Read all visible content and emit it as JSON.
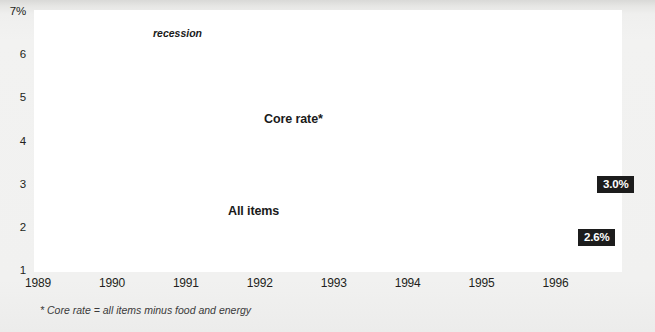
{
  "chart_data": {
    "type": "line",
    "title": "",
    "xlabel": "",
    "ylabel": "",
    "ylim": [
      1,
      7
    ],
    "xlim": [
      1989.0,
      1996.9
    ],
    "grid": true,
    "legend_position": "inline-annotations",
    "y_ticks": [
      "1",
      "2",
      "3",
      "4",
      "5",
      "6",
      "7%"
    ],
    "y_tick_values": [
      1,
      2,
      3,
      4,
      5,
      6,
      7
    ],
    "x_ticks": [
      "1989",
      "1990",
      "1991",
      "1992",
      "1993",
      "1994",
      "1995",
      "1996"
    ],
    "x_tick_values": [
      1989,
      1990,
      1991,
      1992,
      1993,
      1994,
      1995,
      1996
    ],
    "annotations": [
      {
        "text": "recession",
        "type": "band-label",
        "x_start": 1990.47,
        "x_end": 1991.27
      },
      {
        "text": "Core rate*",
        "type": "series-label",
        "series": "Core rate*"
      },
      {
        "text": "All items",
        "type": "series-label",
        "series": "All items"
      },
      {
        "text": "3.0%",
        "type": "end-callout",
        "series": "All items",
        "value": 3.0
      },
      {
        "text": "2.6%",
        "type": "end-callout",
        "series": "Core rate*",
        "value": 2.6
      }
    ],
    "footnote": "* Core rate = all items minus food and energy",
    "series": [
      {
        "name": "All items",
        "style": "solid",
        "color": "#8a8a8a",
        "x": [
          1989.0,
          1989.1,
          1989.2,
          1989.3,
          1989.4,
          1989.5,
          1989.6,
          1989.7,
          1989.8,
          1989.9,
          1990.0,
          1990.1,
          1990.2,
          1990.3,
          1990.4,
          1990.5,
          1990.6,
          1990.7,
          1990.8,
          1990.9,
          1991.0,
          1991.1,
          1991.2,
          1991.3,
          1991.4,
          1991.5,
          1991.6,
          1991.7,
          1991.8,
          1991.9,
          1992.0,
          1992.1,
          1992.2,
          1992.3,
          1992.4,
          1992.5,
          1992.6,
          1992.7,
          1992.8,
          1992.9,
          1993.0,
          1993.1,
          1993.2,
          1993.3,
          1993.4,
          1993.5,
          1993.6,
          1993.7,
          1993.8,
          1993.9,
          1994.0,
          1994.1,
          1994.2,
          1994.3,
          1994.4,
          1994.5,
          1994.6,
          1994.7,
          1994.8,
          1994.9,
          1995.0,
          1995.1,
          1995.2,
          1995.3,
          1995.4,
          1995.5,
          1995.6,
          1995.7,
          1995.8,
          1995.9,
          1996.0,
          1996.1,
          1996.2,
          1996.3,
          1996.4,
          1996.5,
          1996.6,
          1996.7,
          1996.8
        ],
        "y": [
          4.7,
          4.8,
          4.95,
          5.05,
          5.0,
          4.75,
          4.55,
          4.45,
          4.6,
          4.75,
          4.65,
          4.4,
          4.55,
          4.8,
          5.05,
          4.9,
          4.7,
          5.1,
          5.6,
          6.1,
          6.35,
          6.4,
          6.25,
          5.95,
          5.5,
          5.05,
          5.05,
          4.5,
          4.0,
          3.55,
          3.05,
          2.9,
          3.15,
          2.95,
          2.55,
          3.05,
          3.1,
          3.15,
          3.05,
          3.05,
          3.0,
          3.15,
          3.1,
          3.05,
          2.85,
          2.95,
          3.1,
          2.95,
          2.75,
          3.05,
          3.2,
          3.1,
          3.05,
          2.8,
          2.55,
          2.45,
          2.35,
          2.4,
          2.65,
          2.85,
          2.85,
          2.7,
          2.85,
          3.0,
          2.95,
          2.85,
          2.6,
          2.45,
          2.55,
          2.6,
          2.55,
          2.7,
          2.8,
          2.85,
          2.9,
          2.95,
          2.9,
          2.95,
          3.0
        ]
      },
      {
        "name": "Core rate*",
        "style": "dashed",
        "color": "#1a1a1a",
        "x": [
          1989.0,
          1989.1,
          1989.2,
          1989.3,
          1989.4,
          1989.5,
          1989.6,
          1989.7,
          1989.8,
          1989.9,
          1990.0,
          1990.1,
          1990.2,
          1990.3,
          1990.4,
          1990.5,
          1990.6,
          1990.7,
          1990.8,
          1990.9,
          1991.0,
          1991.1,
          1991.2,
          1991.3,
          1991.4,
          1991.5,
          1991.6,
          1991.7,
          1991.8,
          1991.9,
          1992.0,
          1992.1,
          1992.2,
          1992.3,
          1992.4,
          1992.5,
          1992.6,
          1992.7,
          1992.8,
          1992.9,
          1993.0,
          1993.1,
          1993.2,
          1993.3,
          1993.4,
          1993.5,
          1993.6,
          1993.7,
          1993.8,
          1993.9,
          1994.0,
          1994.1,
          1994.2,
          1994.3,
          1994.4,
          1994.5,
          1994.6,
          1994.7,
          1994.8,
          1994.9,
          1995.0,
          1995.1,
          1995.2,
          1995.3,
          1995.4,
          1995.5,
          1995.6,
          1995.7,
          1995.8,
          1995.9,
          1996.0,
          1996.1,
          1996.2,
          1996.3,
          1996.4,
          1996.5,
          1996.6,
          1996.7,
          1996.8
        ],
        "y": [
          4.65,
          4.45,
          4.35,
          4.45,
          4.5,
          4.45,
          4.35,
          4.3,
          4.3,
          4.4,
          4.55,
          4.5,
          4.55,
          4.6,
          4.6,
          4.75,
          4.95,
          5.25,
          5.5,
          5.4,
          5.2,
          5.25,
          5.55,
          5.6,
          5.4,
          5.05,
          5.0,
          4.85,
          4.7,
          4.6,
          4.5,
          4.3,
          4.35,
          4.2,
          4.0,
          3.85,
          3.75,
          3.7,
          3.55,
          3.6,
          3.6,
          3.5,
          3.45,
          3.35,
          3.25,
          3.3,
          3.35,
          3.3,
          3.25,
          3.2,
          3.25,
          3.15,
          3.05,
          3.0,
          2.95,
          2.85,
          2.9,
          2.85,
          2.9,
          3.0,
          2.95,
          2.9,
          2.9,
          2.85,
          2.95,
          3.0,
          3.0,
          2.95,
          2.9,
          2.85,
          2.8,
          2.75,
          2.7,
          2.65,
          2.6,
          2.6,
          2.62,
          2.6,
          2.6
        ]
      }
    ]
  },
  "labels": {
    "core_rate": "Core rate*",
    "all_items": "All items",
    "recession": "recession",
    "callout_all_items": "3.0%",
    "callout_core_rate": "2.6%",
    "footnote": "* Core rate = all items minus food and energy"
  },
  "colors": {
    "all_items_line": "#8a8a8a",
    "core_rate_line": "#1a1a1a",
    "recession_band": "#c9c9c9",
    "callout_bg": "#1c1c1c",
    "plot_bg": "#ffffff",
    "page_bg": "#efefee"
  }
}
